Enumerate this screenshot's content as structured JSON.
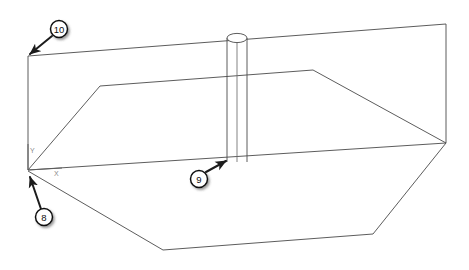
{
  "diagram": {
    "background_color": "#ffffff",
    "line_color": "#4a4a4a",
    "callout_color": "#101010",
    "axes": {
      "x_label": "X",
      "y_label": "Y",
      "origin_label": ""
    },
    "callouts": [
      {
        "id": "callout-10",
        "number": "10",
        "balloon_cx": 59,
        "balloon_cy": 29,
        "balloon_r": 8.5,
        "leader_from_x": 52,
        "leader_from_y": 36,
        "leader_to_x": 28,
        "leader_to_y": 56,
        "target": "outer-box-top-left-corner"
      },
      {
        "id": "callout-9",
        "number": "9",
        "balloon_cx": 199,
        "balloon_cy": 179,
        "balloon_r": 8.5,
        "leader_from_x": 206,
        "leader_from_y": 172,
        "leader_to_x": 228,
        "leader_to_y": 160,
        "target": "cylinder-base"
      },
      {
        "id": "callout-8",
        "number": "8",
        "balloon_cx": 44,
        "balloon_cy": 217,
        "balloon_r": 8.5,
        "leader_from_x": 40,
        "leader_from_y": 209,
        "leader_to_x": 28,
        "leader_to_y": 173,
        "target": "origin-corner"
      }
    ],
    "geometry": {
      "outer_box": {
        "name": "outer-enclosure",
        "top_face": "M 28,56 L 446,24 L 446,143 L 28,170 Z",
        "left_edge": "M 28,56 L 28,170",
        "right_edge": "M 446,24 L 446,143"
      },
      "inner_prism": {
        "name": "inner-hopper-prism",
        "top_outline": "M 28,170 L 100,86 L 313,70 L 446,143",
        "bottom_outline": "M 28,171 L 163,250 L 373,234 L 446,143"
      },
      "cylinder": {
        "name": "vertical-column",
        "left_x": 227,
        "right_x": 247,
        "center_x": 237,
        "top_y": 38,
        "bottom_y": 162,
        "ellipse_rx": 10,
        "ellipse_ry": 4.5
      }
    }
  }
}
